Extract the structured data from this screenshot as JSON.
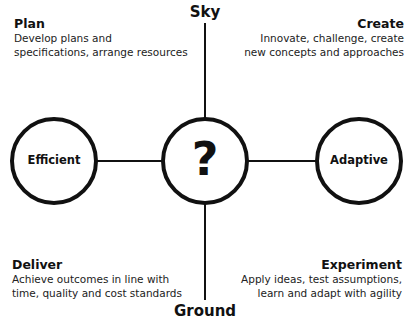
{
  "axes": {
    "top": "Sky",
    "bottom": "Ground"
  },
  "center": {
    "symbol": "?"
  },
  "nodes": {
    "left": "Efficient",
    "right": "Adaptive"
  },
  "quadrants": {
    "top_left": {
      "title": "Plan",
      "lines": [
        "Develop plans and",
        "specifications, arrange resources"
      ]
    },
    "top_right": {
      "title": "Create",
      "lines": [
        "Innovate, challenge, create",
        "new concepts and approaches"
      ]
    },
    "bottom_left": {
      "title": "Deliver",
      "lines": [
        "Achieve outcomes in line with",
        "time, quality and cost standards"
      ]
    },
    "bottom_right": {
      "title": "Experiment",
      "lines": [
        "Apply ideas, test assumptions,",
        "learn and adapt with agility"
      ]
    }
  },
  "colors": {
    "stroke": "#111111",
    "background": "#ffffff"
  }
}
